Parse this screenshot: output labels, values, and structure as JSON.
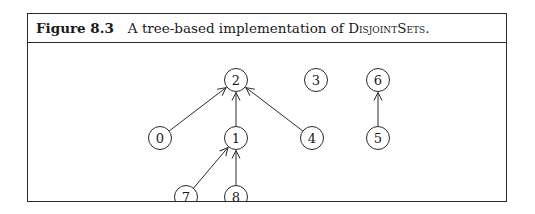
{
  "figure": {
    "label": "Figure 8.3",
    "caption_prefix": "A tree-based implementation of ",
    "caption_name": "DisjointSets",
    "caption_suffix": "."
  },
  "nodes": [
    {
      "id": "2",
      "label": "2",
      "x": 208,
      "y": 37
    },
    {
      "id": "3",
      "label": "3",
      "x": 288,
      "y": 37
    },
    {
      "id": "6",
      "label": "6",
      "x": 350,
      "y": 37
    },
    {
      "id": "0",
      "label": "0",
      "x": 132,
      "y": 95
    },
    {
      "id": "1",
      "label": "1",
      "x": 208,
      "y": 95
    },
    {
      "id": "4",
      "label": "4",
      "x": 284,
      "y": 95
    },
    {
      "id": "5",
      "label": "5",
      "x": 350,
      "y": 95
    },
    {
      "id": "7",
      "label": "7",
      "x": 158,
      "y": 154
    },
    {
      "id": "8",
      "label": "8",
      "x": 208,
      "y": 154
    }
  ],
  "edges": [
    {
      "from": "0",
      "to": "2"
    },
    {
      "from": "1",
      "to": "2"
    },
    {
      "from": "4",
      "to": "2"
    },
    {
      "from": "7",
      "to": "1"
    },
    {
      "from": "8",
      "to": "1"
    },
    {
      "from": "5",
      "to": "6"
    }
  ],
  "style": {
    "stroke": "#2a2a2a",
    "node_radius": 11.5
  }
}
